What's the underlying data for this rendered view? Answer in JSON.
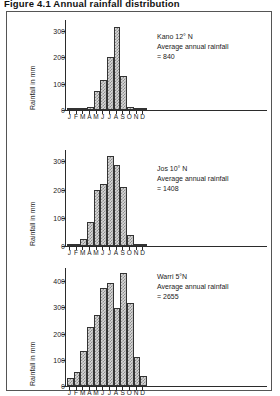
{
  "figure": {
    "title": "Figure 4.1   Annual rainfall distribution",
    "ylabel": "Rainfall in mm",
    "months": [
      "J",
      "F",
      "M",
      "A",
      "M",
      "J",
      "J",
      "A",
      "S",
      "O",
      "N",
      "D"
    ]
  },
  "chart_data": [
    {
      "type": "bar",
      "title": "Kano 12° N",
      "station": "Kano",
      "latitude": "12° N",
      "annotation_line2": "Average annual rainfall",
      "annotation_line3": "= 840",
      "annual_total": 840,
      "xlabel": "",
      "ylabel": "Rainfall in mm",
      "categories": [
        "J",
        "F",
        "M",
        "A",
        "M",
        "J",
        "J",
        "A",
        "S",
        "O",
        "N",
        "D"
      ],
      "values": [
        2,
        1,
        3,
        10,
        70,
        115,
        200,
        315,
        130,
        13,
        2,
        1
      ],
      "ylim": [
        0,
        340
      ],
      "yticks": [
        0,
        100,
        200,
        300
      ],
      "grid": false,
      "legend": "none"
    },
    {
      "type": "bar",
      "title": "Jos 10° N",
      "station": "Jos",
      "latitude": "10° N",
      "annotation_line2": "Average annual rainfall",
      "annotation_line3": "= 1408",
      "annual_total": 1408,
      "xlabel": "",
      "ylabel": "Rainfall in mm",
      "categories": [
        "J",
        "F",
        "M",
        "A",
        "M",
        "J",
        "J",
        "A",
        "S",
        "O",
        "N",
        "D"
      ],
      "values": [
        2,
        2,
        25,
        85,
        198,
        220,
        318,
        288,
        208,
        40,
        3,
        2
      ],
      "ylim": [
        0,
        340
      ],
      "yticks": [
        0,
        100,
        200,
        300
      ],
      "grid": false,
      "legend": "none"
    },
    {
      "type": "bar",
      "title": "Warri 5°N",
      "station": "Warri",
      "latitude": "5°N",
      "annotation_line2": "Average annual rainfall",
      "annotation_line3": "= 2655",
      "annual_total": 2655,
      "xlabel": "",
      "ylabel": "Rainfall in mm",
      "categories": [
        "J",
        "F",
        "M",
        "A",
        "M",
        "J",
        "J",
        "A",
        "S",
        "O",
        "N",
        "D"
      ],
      "values": [
        32,
        55,
        132,
        225,
        270,
        372,
        392,
        297,
        430,
        318,
        112,
        38
      ],
      "ylim": [
        0,
        450
      ],
      "yticks": [
        0,
        100,
        200,
        300,
        400
      ],
      "grid": false,
      "legend": "none"
    }
  ]
}
